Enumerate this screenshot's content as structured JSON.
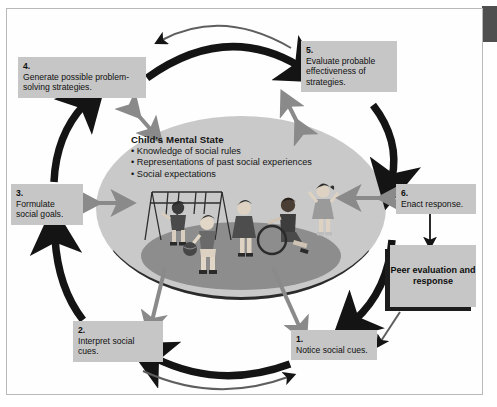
{
  "figure": {
    "type": "cyclical-process-diagram"
  },
  "center": {
    "heading": "Child's Mental State",
    "bullets": [
      "• Knowledge of social rules",
      "• Representations of past social experiences",
      "• Social expectations"
    ]
  },
  "steps": [
    {
      "id": "step1",
      "num": "1.",
      "text": "Notice social cues."
    },
    {
      "id": "step2",
      "num": "2.",
      "text": "Interpret social cues."
    },
    {
      "id": "step3",
      "num": "3.",
      "text": "Formulate social goals."
    },
    {
      "id": "step4",
      "num": "4.",
      "text": "Generate possible problem-solving strategies."
    },
    {
      "id": "step5",
      "num": "5.",
      "text": "Evaluate probable effectiveness of strategies."
    },
    {
      "id": "step6",
      "num": "6.",
      "text": "Enact response."
    }
  ],
  "outcome": {
    "label": "Peer evaluation and response"
  },
  "illustration": {
    "scene": "playground with children, swing set, ball, hoop, child in wheelchair, and a child standing apart waving",
    "elements": [
      "swing-set",
      "child-on-swing",
      "child-with-ball",
      "child-standing",
      "child-in-wheelchair",
      "hoop",
      "outside-child-waving",
      "ground-ellipse"
    ]
  },
  "colors": {
    "box_fill": "#c6c6c6",
    "ellipse_fill": "#c9c9c9",
    "ground_fill": "#8d8d8d",
    "arrow_black": "#141414",
    "arrow_gray": "#8a8a8a",
    "frame_border": "#b9b9b9",
    "corner_tab": "#4f4f4f"
  }
}
